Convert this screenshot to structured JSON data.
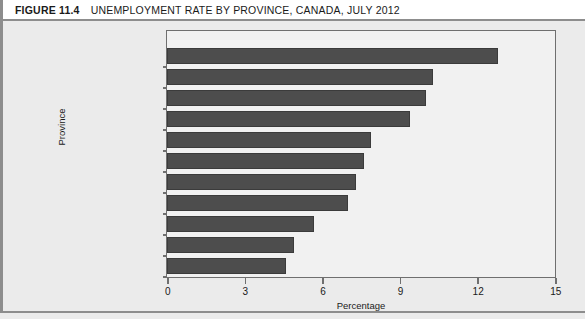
{
  "figure": {
    "number": "FIGURE 11.4",
    "title": "UNEMPLOYMENT RATE BY PROVINCE, CANADA, JULY 2012"
  },
  "chart_data": {
    "type": "bar",
    "orientation": "horizontal",
    "title": "UNEMPLOYMENT RATE BY PROVINCE, CANADA, JULY 2012",
    "xlabel": "Percentage",
    "ylabel": "Province",
    "xlim": [
      0,
      15
    ],
    "xticks": [
      0,
      3,
      6,
      9,
      12,
      15
    ],
    "xtick_labels": [
      "0",
      "3",
      "6",
      "9",
      "12",
      "15"
    ],
    "grid": false,
    "legend": null,
    "bar_color": "#4d4d4d",
    "plot_background": "#f1f1f1",
    "figure_background": "#ebebeb",
    "categories": [
      "Newfoundland  and Labrador",
      "Prince Edward Island",
      "New Brunswick",
      "Nova Scotia",
      "Ontario",
      "Quebec",
      "Canada",
      "British Columbia",
      "Manitoba",
      "Saskatchewan",
      "Alberta"
    ],
    "values": [
      12.8,
      10.3,
      10.0,
      9.4,
      7.9,
      7.6,
      7.3,
      7.0,
      5.7,
      4.9,
      4.6
    ]
  }
}
